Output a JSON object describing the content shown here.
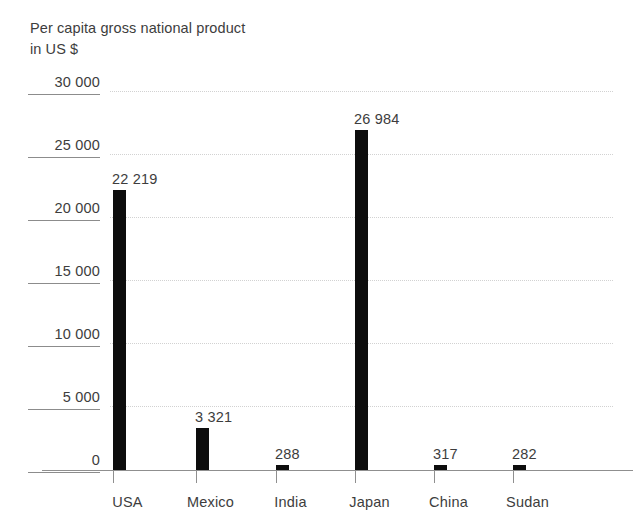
{
  "chart_data": {
    "type": "bar",
    "title": "Per capita gross national product\nin US $",
    "title_line1": "Per capita gross national product",
    "title_line2": "in US $",
    "xlabel": "",
    "ylabel": "",
    "categories": [
      "USA",
      "Mexico",
      "India",
      "Japan",
      "China",
      "Sudan"
    ],
    "values": [
      22219,
      3321,
      288,
      26984,
      317,
      282
    ],
    "value_labels": [
      "22 219",
      "3 321",
      "288",
      "26 984",
      "317",
      "282"
    ],
    "ylim": [
      0,
      30000
    ],
    "ytick_values": [
      30000,
      25000,
      20000,
      15000,
      10000,
      5000,
      0
    ],
    "ytick_labels": [
      "30 000",
      "25 000",
      "20 000",
      "15 000",
      "10 000",
      "5 000",
      "0"
    ],
    "grid": true,
    "grid_style": "dotted",
    "legend": null,
    "legend_position": "none",
    "bar_color": "#0d0d0d",
    "grid_color": "#d2d2d2",
    "axis_color": "#8f8f8f",
    "text_color": "#3d3d3d",
    "background_color": "#ffffff"
  }
}
